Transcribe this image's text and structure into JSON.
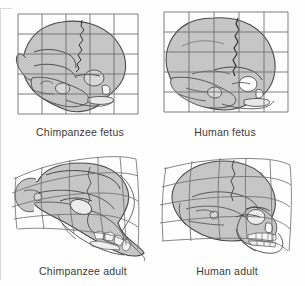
{
  "figure": {
    "title_visible": false,
    "background_color": "#fefefe",
    "panel_count": 4
  },
  "colors": {
    "bone_fill": "#c6c6c6",
    "bone_fill_light": "#d8d8d8",
    "outline": "#4a4a4a",
    "suture": "#2e2e2e",
    "grid": "#6f6f6f",
    "caption_text": "#3a3a3a",
    "background": "#fefefe",
    "tooth_fill": "#f2f2f2"
  },
  "panels": [
    {
      "id": "chimpanzee-fetus",
      "caption": "Chimpanzee fetus",
      "grid_type": "rectangular",
      "grid_columns": 5,
      "grid_rows": 5,
      "species": "Chimpanzee",
      "stage": "fetus"
    },
    {
      "id": "human-fetus",
      "caption": "Human fetus",
      "grid_type": "rectangular",
      "grid_columns": 5,
      "grid_rows": 5,
      "species": "Human",
      "stage": "fetus"
    },
    {
      "id": "chimpanzee-adult",
      "caption": "Chimpanzee adult",
      "grid_type": "deformed",
      "grid_columns": 5,
      "grid_rows": 5,
      "species": "Chimpanzee",
      "stage": "adult"
    },
    {
      "id": "human-adult",
      "caption": "Human adult",
      "grid_type": "deformed",
      "grid_columns": 5,
      "grid_rows": 5,
      "species": "Human",
      "stage": "adult"
    }
  ],
  "captions": {
    "chimp_fetus": "Chimpanzee fetus",
    "human_fetus": "Human fetus",
    "chimp_adult": "Chimpanzee adult",
    "human_adult": "Human adult"
  }
}
